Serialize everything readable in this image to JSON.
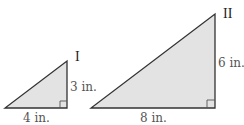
{
  "figure": {
    "fill_color": "#e3e3e3",
    "stroke_color": "#333333",
    "triangles": [
      {
        "name": "I",
        "vertical_leg_label": "3 in.",
        "horizontal_leg_label": "4 in.",
        "right_angle_marker": true
      },
      {
        "name": "II",
        "vertical_leg_label": "6 in.",
        "horizontal_leg_label": "8 in.",
        "right_angle_marker": true
      }
    ]
  }
}
